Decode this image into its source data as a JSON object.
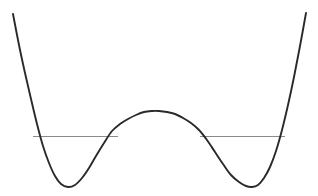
{
  "figure": {
    "kind": "double-well-potential-plot",
    "background_color": "#ffffff",
    "width": 318,
    "height": 196
  },
  "chart_data": {
    "type": "line",
    "title": "",
    "subtitle": "",
    "xlabel": "",
    "ylabel": "",
    "xlim": [
      0,
      318
    ],
    "ylim": [
      196,
      0
    ],
    "grid": false,
    "legend": null,
    "axes_visible": false,
    "tick_labels": {
      "x": [],
      "y": []
    },
    "annotations": [],
    "series": [
      {
        "name": "potential-curve",
        "kind": "double-well-potential",
        "color": "#2a2a2a",
        "line_width": 1.9,
        "points": [
          [
            13,
            14
          ],
          [
            19,
            45
          ],
          [
            25,
            73
          ],
          [
            31,
            99
          ],
          [
            37,
            124
          ],
          [
            43,
            146
          ],
          [
            49,
            163
          ],
          [
            55,
            176
          ],
          [
            61,
            184
          ],
          [
            68,
            187
          ],
          [
            75,
            185
          ],
          [
            82,
            178
          ],
          [
            89,
            168
          ],
          [
            96,
            156
          ],
          [
            104,
            143
          ],
          [
            112,
            131
          ],
          [
            120,
            124
          ],
          [
            128,
            119
          ],
          [
            136,
            115
          ],
          [
            144,
            112
          ],
          [
            152,
            111
          ],
          [
            159,
            111
          ],
          [
            167,
            112
          ],
          [
            175,
            114
          ],
          [
            183,
            118
          ],
          [
            191,
            123
          ],
          [
            199,
            130
          ],
          [
            207,
            140
          ],
          [
            215,
            152
          ],
          [
            223,
            164
          ],
          [
            231,
            175
          ],
          [
            239,
            182
          ],
          [
            246,
            186
          ],
          [
            252,
            187
          ],
          [
            258,
            185
          ],
          [
            264,
            178
          ],
          [
            270,
            167
          ],
          [
            276,
            151
          ],
          [
            282,
            130
          ],
          [
            288,
            105
          ],
          [
            294,
            77
          ],
          [
            300,
            46
          ],
          [
            306,
            13
          ]
        ]
      }
    ],
    "horizontal_markers": [
      {
        "name": "energy-level-left",
        "y": 136,
        "x_start": 33,
        "x_end": 118,
        "color": "#8a8a8a",
        "line_width": 1
      },
      {
        "name": "energy-level-right",
        "y": 136,
        "x_start": 200,
        "x_end": 285,
        "color": "#8a8a8a",
        "line_width": 1
      }
    ],
    "features": {
      "left_minimum": [
        68,
        187
      ],
      "right_minimum": [
        252,
        187
      ],
      "central_maximum": [
        159,
        111
      ],
      "left_branch_top": [
        13,
        14
      ],
      "right_branch_top": [
        306,
        13
      ],
      "energy_level_y": 136
    }
  }
}
